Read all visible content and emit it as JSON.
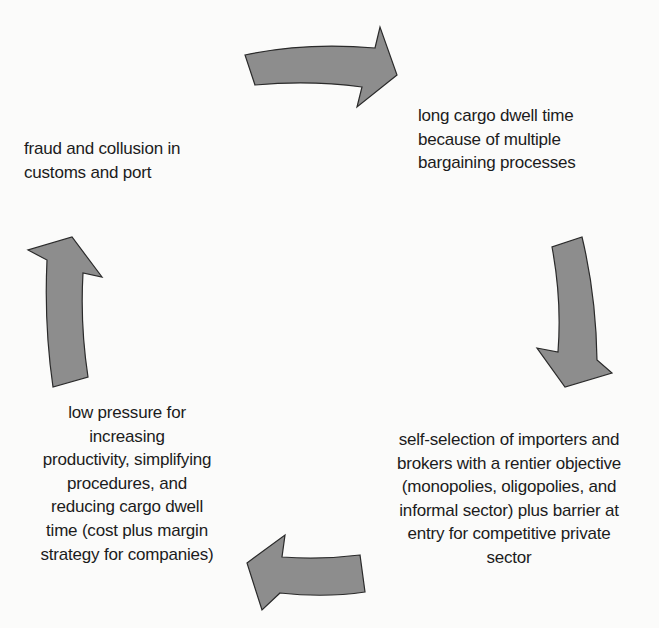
{
  "diagram": {
    "type": "cycle",
    "direction": "clockwise",
    "colors": {
      "arrow_fill": "#8d8d8d",
      "arrow_stroke": "#2a2a2a",
      "text": "#1c1c1c",
      "background": "#fbfbfa"
    },
    "nodes": [
      {
        "id": "top-right",
        "label": "long cargo dwell time\nbecause of multiple\nbargaining processes"
      },
      {
        "id": "bottom-right",
        "label": "self-selection of importers and\nbrokers with a rentier objective\n(monopolies, oligopolies, and\ninformal sector) plus barrier at\nentry for competitive private\nsector"
      },
      {
        "id": "bottom-left",
        "label": "low pressure for\nincreasing\nproductivity, simplifying\nprocedures, and\nreducing cargo dwell\ntime (cost plus margin\nstrategy for companies)"
      },
      {
        "id": "top-left",
        "label": "fraud and collusion in\ncustoms and port"
      }
    ],
    "edges": [
      {
        "from": "top-left",
        "to": "top-right",
        "icon": "curved-arrow-right-icon"
      },
      {
        "from": "top-right",
        "to": "bottom-right",
        "icon": "curved-arrow-down-icon"
      },
      {
        "from": "bottom-right",
        "to": "bottom-left",
        "icon": "curved-arrow-left-icon"
      },
      {
        "from": "bottom-left",
        "to": "top-left",
        "icon": "curved-arrow-up-icon"
      }
    ]
  }
}
